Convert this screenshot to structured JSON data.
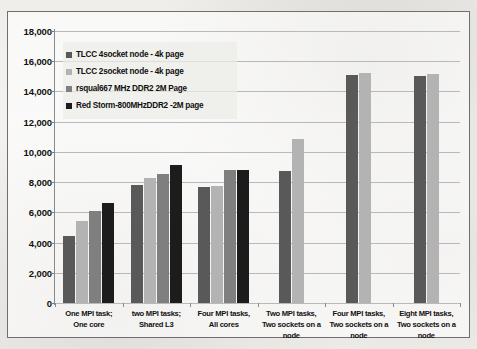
{
  "chart_data": {
    "type": "bar",
    "title": "",
    "xlabel": "",
    "ylabel": "",
    "ylim": [
      0,
      18000
    ],
    "ytick_step": 2000,
    "ytick_labels": [
      "18,000",
      "16,000",
      "14,000",
      "12,000",
      "10,000",
      "8,000",
      "6,000",
      "4,000",
      "2,000",
      "0"
    ],
    "ytick_values": [
      18000,
      16000,
      14000,
      12000,
      10000,
      8000,
      6000,
      4000,
      2000,
      0
    ],
    "grid": true,
    "legend_position": "upper-left-inside",
    "categories": [
      "One MPI task; One core",
      "two MPI tasks; Shared L3",
      "Four MPI tasks, All cores",
      "Two MPI tasks, Two sockets on a node",
      "Four MPI tasks, Two sockets on a node",
      "Eight MPI tasks, Two sockets on a node"
    ],
    "category_lines": [
      [
        "One MPI task;",
        "One core"
      ],
      [
        "two MPI tasks;",
        "Shared L3"
      ],
      [
        "Four MPI tasks,",
        "All cores"
      ],
      [
        "Two MPI tasks,",
        "Two sockets on a",
        "node"
      ],
      [
        "Four MPI tasks,",
        "Two sockets on a",
        "node"
      ],
      [
        "Eight MPI tasks,",
        "Two sockets on a",
        "node"
      ]
    ],
    "series": [
      {
        "name": "TLCC 4socket node - 4k page",
        "color": "#595959",
        "values": [
          4450,
          7780,
          7650,
          8720,
          15120,
          15030
        ]
      },
      {
        "name": "TLCC 2socket node - 4k page",
        "color": "#b3b3b3",
        "values": [
          5430,
          8300,
          7740,
          10830,
          15250,
          15180
        ]
      },
      {
        "name": "rsqual667 MHz DDR2 2M Page",
        "color": "#7f7f7f",
        "values": [
          6100,
          8540,
          8800,
          null,
          null,
          null
        ]
      },
      {
        "name": "Red Storm-800MHzDDR2 -2M page",
        "color": "#1c1c1c",
        "values": [
          6650,
          9120,
          8780,
          null,
          null,
          null
        ]
      }
    ]
  }
}
